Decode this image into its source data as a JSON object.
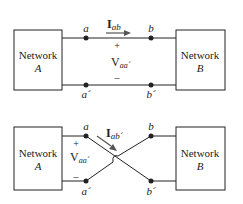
{
  "diagrams": [
    {
      "id": "straight",
      "network_left": {
        "line1": "Network",
        "line2": "A"
      },
      "network_right": {
        "line1": "Network",
        "line2": "B"
      },
      "nodes": {
        "a": "a",
        "b": "b",
        "a_prime": "a´",
        "b_prime": "b´"
      },
      "current": {
        "symbol": "I",
        "subscript": "ab"
      },
      "voltage": {
        "symbol": "V",
        "subscript": "aa´",
        "plus": "+",
        "minus": "–"
      }
    },
    {
      "id": "crossed",
      "network_left": {
        "line1": "Network",
        "line2": "A"
      },
      "network_right": {
        "line1": "Network",
        "line2": "B"
      },
      "nodes": {
        "a": "a",
        "b": "b",
        "a_prime": "a´",
        "b_prime": "b´"
      },
      "current": {
        "symbol": "I",
        "subscript": "ab´"
      },
      "voltage": {
        "symbol": "V",
        "subscript": "aa´",
        "plus": "+",
        "minus": "–"
      }
    }
  ],
  "colors": {
    "line": "#222222",
    "arrow": "#555555"
  }
}
